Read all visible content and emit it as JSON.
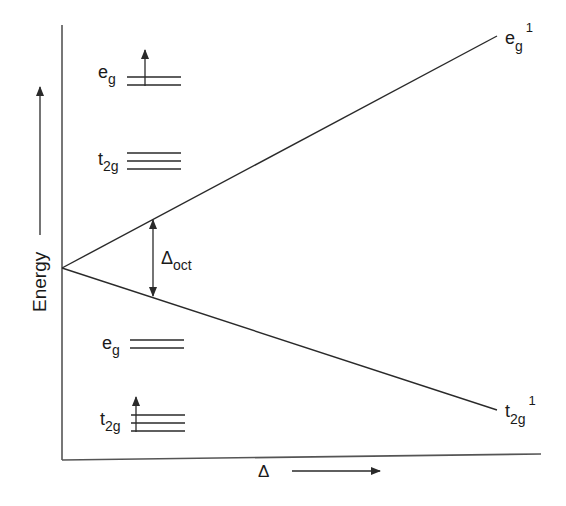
{
  "diagram": {
    "title": "",
    "y_axis_label": "Energy",
    "x_axis_label": "Δ",
    "line_color": "#2a2a2a",
    "upper_line_label": {
      "base": "e",
      "sub": "g",
      "sup": "1"
    },
    "lower_line_label": {
      "base": "t",
      "sub": "2g",
      "sup": "1"
    },
    "splitting_label": {
      "base": "Δ",
      "sub": "oct"
    },
    "upper_config": {
      "eg": {
        "base": "e",
        "sub": "g",
        "lines": 2,
        "electrons": 1
      },
      "t2g": {
        "base": "t",
        "sub": "2g",
        "lines": 3,
        "electrons": 0
      }
    },
    "lower_config": {
      "eg": {
        "base": "e",
        "sub": "g",
        "lines": 2,
        "electrons": 0
      },
      "t2g": {
        "base": "t",
        "sub": "2g",
        "lines": 3,
        "electrons": 1
      }
    }
  }
}
